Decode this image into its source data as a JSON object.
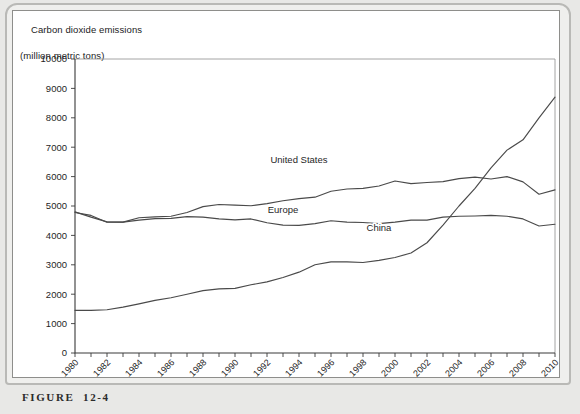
{
  "figure": {
    "caption": "FIGURE  12-4"
  },
  "chart_data": {
    "type": "line",
    "title": "Carbon dioxide emissions",
    "subtitle": "(million metric tons)",
    "ylabel": "Carbon dioxide emissions (million metric tons)",
    "xlabel": "",
    "ylim": [
      0,
      10000
    ],
    "xlim": [
      1980,
      2010
    ],
    "ytick_labels": [
      "10000",
      "9000",
      "8000",
      "7000",
      "6000",
      "5000",
      "4000",
      "3000",
      "2000",
      "1000",
      "0"
    ],
    "ytick_values": [
      10000,
      9000,
      8000,
      7000,
      6000,
      5000,
      4000,
      3000,
      2000,
      1000,
      0
    ],
    "xtick_labels": [
      "1980",
      "1982",
      "1984",
      "1986",
      "1988",
      "1990",
      "1992",
      "1994",
      "1996",
      "1998",
      "2000",
      "2002",
      "2004",
      "2006",
      "2008",
      "2010"
    ],
    "x": [
      1980,
      1981,
      1982,
      1983,
      1984,
      1985,
      1986,
      1987,
      1988,
      1989,
      1990,
      1991,
      1992,
      1993,
      1994,
      1995,
      1996,
      1997,
      1998,
      1999,
      2000,
      2001,
      2002,
      2003,
      2004,
      2005,
      2006,
      2007,
      2008,
      2009,
      2010
    ],
    "grid": false,
    "legend_position": "inline-labels",
    "line_color": "#4a4a4a",
    "series": [
      {
        "name": "United States",
        "label_x": 1994,
        "label_y": 6450,
        "values": [
          4780,
          4680,
          4450,
          4450,
          4600,
          4630,
          4650,
          4780,
          4980,
          5050,
          5030,
          5010,
          5080,
          5180,
          5250,
          5300,
          5500,
          5580,
          5600,
          5680,
          5850,
          5760,
          5800,
          5830,
          5930,
          5980,
          5920,
          6000,
          5820,
          5400,
          5550
        ]
      },
      {
        "name": "Europe",
        "label_x": 1993,
        "label_y": 4750,
        "values": [
          4800,
          4620,
          4460,
          4450,
          4520,
          4570,
          4580,
          4640,
          4620,
          4560,
          4530,
          4560,
          4430,
          4350,
          4340,
          4400,
          4500,
          4450,
          4440,
          4400,
          4450,
          4520,
          4520,
          4620,
          4650,
          4660,
          4680,
          4650,
          4560,
          4320,
          4380
        ]
      },
      {
        "name": "China",
        "label_x": 1999,
        "label_y": 4150,
        "values": [
          1450,
          1450,
          1470,
          1560,
          1670,
          1790,
          1880,
          2000,
          2120,
          2180,
          2200,
          2320,
          2420,
          2570,
          2750,
          3000,
          3100,
          3100,
          3080,
          3150,
          3250,
          3400,
          3750,
          4350,
          5000,
          5600,
          6300,
          6900,
          7250,
          8000,
          8700
        ]
      }
    ]
  }
}
